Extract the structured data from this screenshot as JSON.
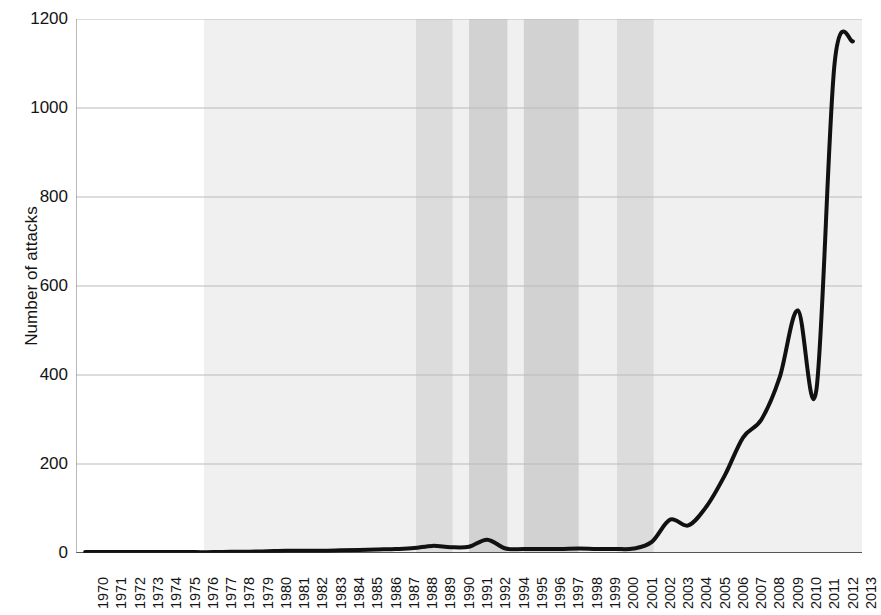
{
  "chart_data": {
    "type": "line",
    "title": "",
    "xlabel": "",
    "ylabel": "Number of attacks",
    "ylim": [
      0,
      1200
    ],
    "ytick_values": [
      0,
      200,
      400,
      600,
      800,
      1000,
      1200
    ],
    "ytick_labels": [
      "0",
      "200",
      "400",
      "600",
      "800",
      "1000",
      "1200"
    ],
    "grid": "horizontal",
    "legend": "none",
    "line_color": "#111111",
    "line_width_px": 4,
    "note_missing_year": "1993",
    "categories": [
      "1970",
      "1971",
      "1972",
      "1973",
      "1974",
      "1975",
      "1976",
      "1977",
      "1978",
      "1979",
      "1980",
      "1981",
      "1982",
      "1983",
      "1984",
      "1985",
      "1986",
      "1987",
      "1988",
      "1989",
      "1990",
      "1991",
      "1992",
      "1994",
      "1995",
      "1996",
      "1997",
      "1998",
      "1999",
      "2000",
      "2001",
      "2002",
      "2003",
      "2004",
      "2005",
      "2006",
      "2007",
      "2008",
      "2009",
      "2010",
      "2011",
      "2012",
      "2013"
    ],
    "values": [
      2,
      2,
      2,
      2,
      2,
      2,
      2,
      2,
      3,
      3,
      4,
      5,
      5,
      5,
      6,
      7,
      8,
      9,
      11,
      16,
      13,
      14,
      30,
      10,
      9,
      9,
      9,
      10,
      9,
      9,
      10,
      25,
      75,
      62,
      105,
      175,
      260,
      300,
      395,
      545,
      365,
      1100,
      1150
    ],
    "background_bands": [
      {
        "from": "1977",
        "to": "2013",
        "shade": "#f0f0f0",
        "label": "light-era-band"
      },
      {
        "from": "1988.6",
        "to": "1989.6",
        "shade": "#dcdcdc",
        "label": "band-1989"
      },
      {
        "from": "1991.5",
        "to": "1992.6",
        "shade": "#d2d2d2",
        "label": "band-1992"
      },
      {
        "from": "1995.5",
        "to": "1997.5",
        "shade": "#d2d2d2",
        "label": "band-1996-1997"
      },
      {
        "from": "2000.6",
        "to": "2001.6",
        "shade": "#dcdcdc",
        "label": "band-2001"
      }
    ],
    "axis_color": "#222222",
    "grid_color": "#b9b9b9"
  }
}
